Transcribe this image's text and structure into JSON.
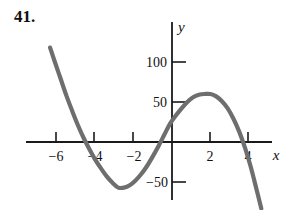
{
  "problem": {
    "number_label": "41."
  },
  "chart_data": {
    "type": "line",
    "title": "",
    "subtitle": "",
    "xlabel": "x",
    "ylabel": "y",
    "grid": false,
    "legend": "none",
    "xlim": [
      -7.2,
      5.6
    ],
    "ylim": [
      -95,
      120
    ],
    "x_ticks": [
      -6,
      -4,
      -2,
      2,
      4
    ],
    "x_tick_labels": [
      "−6",
      "−4",
      "−2",
      "2",
      "4"
    ],
    "y_ticks": [
      -50,
      50,
      100
    ],
    "y_tick_labels": [
      "−50",
      "50",
      "100"
    ],
    "curve_color": "#6e6e6e",
    "axis_color": "#1a1a1a",
    "roots": [
      -4.8,
      -0.45,
      4.0
    ],
    "local_minimum": {
      "x": -2.85,
      "y": -58
    },
    "local_maximum": {
      "x": 2.05,
      "y": 60
    },
    "y_intercept": 22,
    "series": [
      {
        "name": "f(x)",
        "x": [
          -6.35,
          -6.1,
          -5.8,
          -5.5,
          -5.2,
          -4.9,
          -4.6,
          -4.3,
          -4.0,
          -3.7,
          -3.4,
          -3.1,
          -2.8,
          -2.5,
          -2.2,
          -1.9,
          -1.6,
          -1.3,
          -1.0,
          -0.7,
          -0.4,
          -0.1,
          0.2,
          0.5,
          0.8,
          1.1,
          1.4,
          1.7,
          2.0,
          2.3,
          2.6,
          2.9,
          3.2,
          3.5,
          3.8,
          4.1,
          4.4,
          4.65
        ],
        "y": [
          118,
          100,
          79,
          58,
          39,
          21,
          5,
          -9,
          -22,
          -33,
          -43,
          -51,
          -57,
          -57,
          -54,
          -48,
          -40,
          -30,
          -18,
          -5,
          9,
          23,
          33,
          42,
          50,
          56,
          59,
          60,
          60,
          57,
          51,
          42,
          29,
          13,
          -7,
          -31,
          -59,
          -83
        ]
      }
    ]
  }
}
